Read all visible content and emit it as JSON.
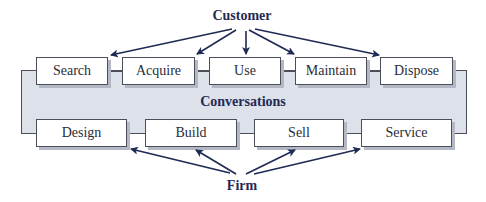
{
  "diagram": {
    "top_label": "Customer",
    "center_label": "Conversations",
    "bottom_label": "Firm",
    "customer_activities": [
      {
        "label": "Search"
      },
      {
        "label": "Acquire"
      },
      {
        "label": "Use"
      },
      {
        "label": "Maintain"
      },
      {
        "label": "Dispose"
      }
    ],
    "firm_activities": [
      {
        "label": "Design"
      },
      {
        "label": "Build"
      },
      {
        "label": "Sell"
      },
      {
        "label": "Service"
      }
    ],
    "colors": {
      "arrow": "#1f2a55",
      "panel": "#dde1ea",
      "box_border": "#4a4f5a",
      "label": "#1f2a55"
    }
  }
}
